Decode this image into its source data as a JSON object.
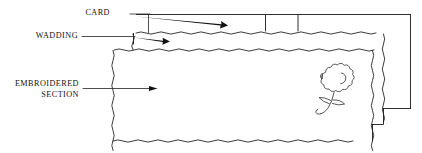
{
  "diagram": {
    "background_color": "#ffffff",
    "ink_color": "#1a1a1a",
    "width": 422,
    "height": 153,
    "labels": {
      "card": "CARD",
      "wadding": "WADDING",
      "embroidered_line1": "EMBROIDERED",
      "embroidered_line2": "SECTION"
    },
    "layers": [
      {
        "name": "card",
        "label": "CARD",
        "description": "Top stiff card strip with two scored division lines"
      },
      {
        "name": "wadding",
        "label": "WADDING",
        "description": "Thin padding band beneath the card"
      },
      {
        "name": "embroidered-section",
        "label": "EMBROIDERED SECTION",
        "description": "Large fabric panel with hand-drawn wavy edges carrying a floral motif"
      }
    ],
    "motif": {
      "name": "flower-motif",
      "description": "Hand-drawn flower with scalloped petals, curved stem and two leaves"
    }
  }
}
